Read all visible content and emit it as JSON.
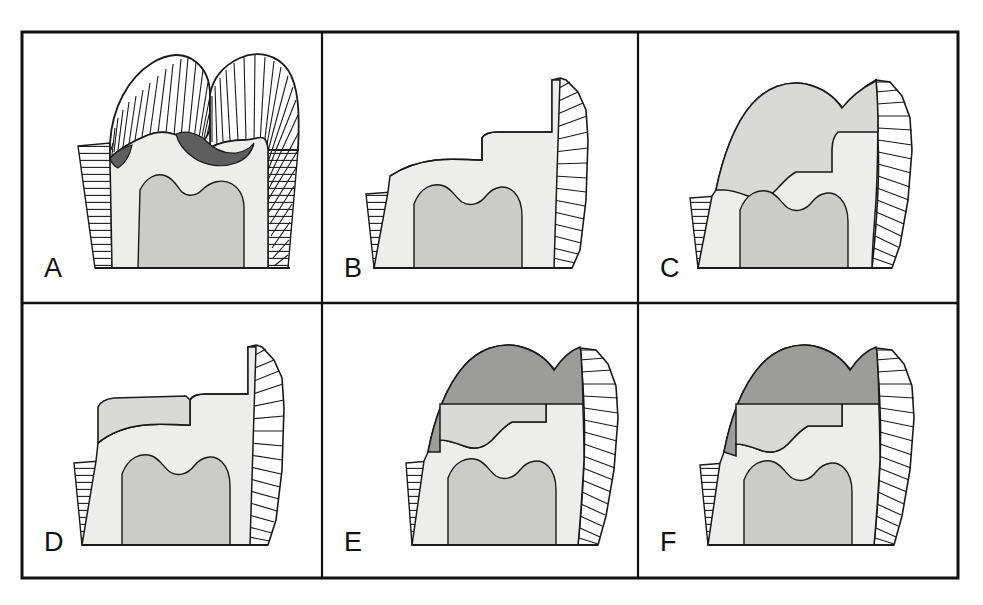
{
  "figure": {
    "type": "diagram",
    "panel_count": 6,
    "grid": {
      "rows": 2,
      "cols": 3
    },
    "frame": {
      "x": 22,
      "y": 32,
      "width": 936,
      "height": 546,
      "stroke": "#111111",
      "stroke_width": 3
    },
    "dividers": {
      "vertical_x": [
        322,
        638
      ],
      "horizontal_y": [
        303
      ]
    }
  },
  "legend_materials": {
    "enamel": {
      "name": "enamel",
      "fill": "#ffffff",
      "pattern": "radial-hatch-lines"
    },
    "cementum": {
      "name": "cementum",
      "fill": "#ffffff",
      "pattern": "horizontal-hatch-lines"
    },
    "dentin": {
      "name": "dentin",
      "fill": "#ededeb"
    },
    "pulp": {
      "name": "pulp",
      "fill": "#cbcbc9"
    },
    "carious_lesion": {
      "name": "carious-lesion",
      "fill": "#5e5e5e"
    },
    "restoration_light": {
      "name": "restoration-light",
      "fill": "#d9d9d7"
    },
    "restoration_dark": {
      "name": "restoration-dark",
      "fill": "#9c9c9a"
    },
    "outline": {
      "name": "outline",
      "stroke": "#1a1a1a"
    }
  },
  "panels": [
    {
      "id": "A",
      "label": "A",
      "label_x": 44,
      "label_y": 277,
      "caption": "Intact tooth with two cusps, enamel fully present, small dark carious lesions at occlusal fissure and cervical margin",
      "features": [
        "enamel-cap",
        "cementum-root",
        "dentin",
        "pulp",
        "carious-lesion"
      ]
    },
    {
      "id": "B",
      "label": "B",
      "label_x": 344,
      "label_y": 277,
      "caption": "Crown worn away; enamel remains only along the right (distal) wall, exposed dentin with stepped occlusal surface",
      "features": [
        "enamel-partial-right",
        "cementum-root",
        "dentin",
        "pulp"
      ]
    },
    {
      "id": "C",
      "label": "C",
      "label_x": 660,
      "label_y": 277,
      "caption": "Large light-grey restoration replacing most of the crown, thin enamel band remaining on right",
      "features": [
        "enamel-partial-right",
        "cementum-root",
        "dentin",
        "pulp",
        "restoration-light"
      ]
    },
    {
      "id": "D",
      "label": "D",
      "label_x": 44,
      "label_y": 551,
      "caption": "Small light-grey restoration confined to the upper mesial corner of the exposed dentin",
      "features": [
        "enamel-partial-right",
        "cementum-root",
        "dentin",
        "pulp",
        "restoration-light"
      ]
    },
    {
      "id": "E",
      "label": "E",
      "label_x": 344,
      "label_y": 551,
      "caption": "Large dark-grey restoration capping the crown and extending down the mesial surface to the cervical margin",
      "features": [
        "enamel-partial-right",
        "cementum-root",
        "dentin",
        "pulp",
        "restoration-dark"
      ]
    },
    {
      "id": "F",
      "label": "F",
      "label_x": 660,
      "label_y": 551,
      "caption": "Dark-grey restoration with stepped internal margin, enamel band on right, restoration reaching mesial cervical area",
      "features": [
        "enamel-partial-right",
        "cementum-root",
        "dentin",
        "pulp",
        "restoration-dark"
      ]
    }
  ]
}
